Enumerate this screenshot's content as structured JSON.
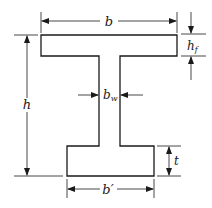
{
  "diagram": {
    "colors": {
      "line": "#1a1a1a",
      "background": "#ffffff"
    },
    "labels": {
      "flange_width": "b",
      "flange_thickness": "h",
      "flange_thickness_sub": "f",
      "web_width": "b",
      "web_width_sub": "w",
      "total_height": "h",
      "bottom_flange_thickness": "t",
      "bottom_flange_width": "b′"
    }
  }
}
